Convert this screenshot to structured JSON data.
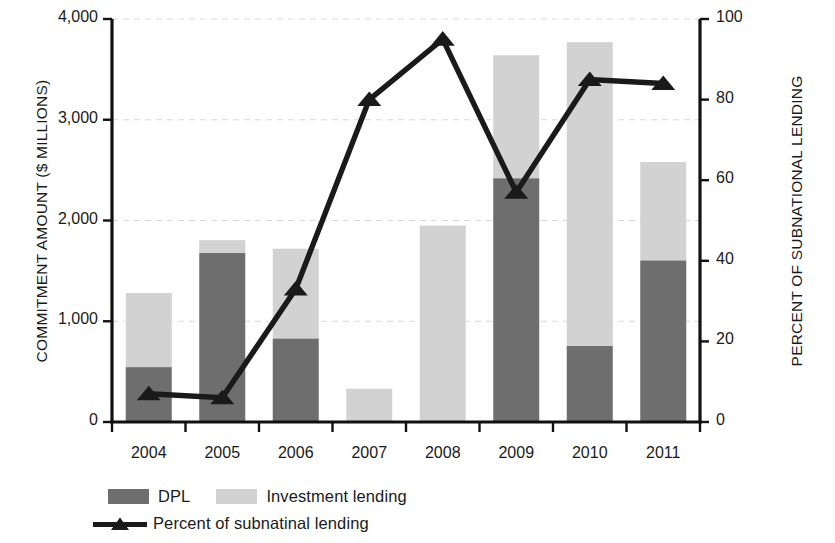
{
  "chart_data": {
    "type": "bar",
    "title": "",
    "subtitle": "",
    "categories": [
      "2004",
      "2005",
      "2006",
      "2007",
      "2008",
      "2009",
      "2010",
      "2011"
    ],
    "xlabel": "",
    "ylabel": "COMMITMENT AMOUNT ($ MILLIONS)",
    "y2label": "PERCENT OF SUBNATIONAL LENDING",
    "ylim": [
      0,
      4000
    ],
    "y2lim": [
      0,
      100
    ],
    "yticks": [
      "0",
      "1,000",
      "2,000",
      "3,000",
      "4,000"
    ],
    "ytick_values": [
      0,
      1000,
      2000,
      3000,
      4000
    ],
    "y2ticks": [
      "0",
      "20",
      "40",
      "60",
      "80",
      "100"
    ],
    "y2tick_values": [
      0,
      20,
      40,
      60,
      80,
      100
    ],
    "grid": true,
    "grid_axis": "y",
    "stacked": true,
    "legend_position": "bottom-left",
    "series": [
      {
        "name": "DPL",
        "type": "bar",
        "axis": "left",
        "color": "#6e6e6e",
        "values": [
          545,
          1680,
          830,
          0,
          0,
          2420,
          755,
          1605
        ]
      },
      {
        "name": "Investment lending",
        "type": "bar",
        "axis": "left",
        "color": "#d2d2d2",
        "values": [
          735,
          125,
          890,
          330,
          1950,
          1220,
          3015,
          975
        ]
      },
      {
        "name": "Percent of subnatinal lending",
        "type": "line",
        "axis": "right",
        "color": "#1a1a1a",
        "marker": "triangle",
        "values": [
          7,
          6,
          33,
          80,
          95,
          57,
          85,
          84
        ]
      }
    ],
    "totals": [
      1280,
      1805,
      1720,
      330,
      1950,
      3640,
      3770,
      2580
    ]
  },
  "axes": {
    "left_title": "COMMITMENT AMOUNT ($ MILLIONS)",
    "right_title": "PERCENT OF SUBNATIONAL LENDING"
  },
  "legend": {
    "dpl_label": "DPL",
    "investment_label": "Investment lending",
    "percent_label": "Percent of subnatinal lending"
  },
  "colors": {
    "dpl": "#6e6e6e",
    "investment": "#d2d2d2",
    "line": "#1a1a1a",
    "axis": "#111111",
    "grid": "#d8d8d8",
    "background": "#ffffff"
  }
}
